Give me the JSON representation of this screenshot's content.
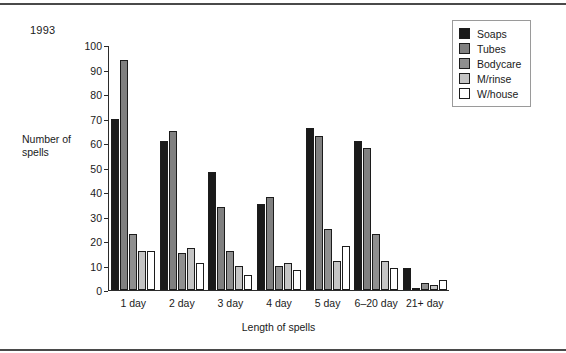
{
  "figure": {
    "year_caption": "1993"
  },
  "chart_data": {
    "type": "bar",
    "title": "1993",
    "xlabel": "Length of spells",
    "ylabel": "Number of spells",
    "ylim": [
      0,
      100
    ],
    "ytick_step": 10,
    "yticks": [
      100,
      90,
      80,
      70,
      60,
      50,
      40,
      30,
      20,
      10,
      0
    ],
    "grid": false,
    "legend_position": "top-right",
    "categories": [
      "1 day",
      "2 day",
      "3 day",
      "4 day",
      "5 day",
      "6–20 day",
      "21+ day"
    ],
    "series": [
      {
        "name": "Soaps",
        "color": "#1a1a1a",
        "values": [
          70,
          61,
          48,
          35,
          66,
          61,
          9
        ]
      },
      {
        "name": "Tubes",
        "color": "#808080",
        "values": [
          94,
          65,
          34,
          38,
          63,
          58,
          1
        ]
      },
      {
        "name": "Bodycare",
        "color": "#8f8f8f",
        "values": [
          23,
          15,
          16,
          10,
          25,
          23,
          3
        ]
      },
      {
        "name": "M/rinse",
        "color": "#c4c4c4",
        "values": [
          16,
          17,
          10,
          11,
          12,
          12,
          2
        ]
      },
      {
        "name": "W/house",
        "color": "#ffffff",
        "values": [
          16,
          11,
          6,
          8,
          18,
          9,
          4
        ]
      }
    ]
  }
}
